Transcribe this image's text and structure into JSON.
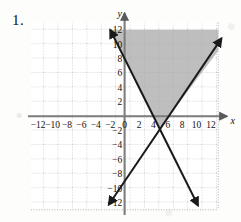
{
  "problem": {
    "number": "1."
  },
  "chart_data": {
    "type": "line",
    "title": "",
    "xlabel": "x",
    "ylabel": "y",
    "xlim": [
      -13,
      13
    ],
    "ylim": [
      -13,
      13
    ],
    "grid": true,
    "grid_style": "dotted",
    "grid_spacing": 2,
    "legend": "none",
    "x_ticks": [
      -12,
      -10,
      -8,
      -6,
      -4,
      -2,
      0,
      2,
      4,
      6,
      8,
      10,
      12
    ],
    "x_tick_labels": [
      "-12",
      "-10",
      "-8",
      "-6",
      "-4",
      "-2",
      "0",
      "2",
      "4",
      "6",
      "8",
      "10",
      "12"
    ],
    "y_ticks": [
      12,
      10,
      8,
      6,
      4,
      2,
      -2,
      -4,
      -6,
      -8,
      -10,
      -12
    ],
    "y_tick_labels": [
      "12",
      "10",
      "8",
      "6",
      "4",
      "2",
      "-2",
      "-4",
      "-6",
      "-8",
      "-10",
      "-12"
    ],
    "grid_x_range": [
      -13,
      13
    ],
    "grid_y_range": [
      -13,
      13
    ],
    "series": [
      {
        "name": "descending-boundary-line",
        "type": "line",
        "slope": -2,
        "intercept": 8,
        "equation": "y = -2x + 8",
        "x_intercept": 4,
        "y_intercept": 8,
        "style": "solid",
        "color": "#1a1a1a",
        "arrows": "both",
        "x_from": -2,
        "x_to": 10.2
      },
      {
        "name": "ascending-boundary-line",
        "type": "line",
        "slope": 1.5,
        "intercept": -9,
        "equation": "y = 1.5x - 9",
        "x_intercept": 6,
        "y_intercept": -9,
        "style": "solid",
        "color": "#1a1a1a",
        "arrows": "both",
        "x_from": -2.2,
        "x_to": 13.2
      }
    ],
    "intersection": [
      4.86,
      -1.71
    ],
    "shaded_region": {
      "name": "solution-region",
      "fill": "#a8a8a8",
      "opacity": 0.72,
      "description": "Region above y = -2x + 8 and above y = 1.5x - 9, clipped to grid",
      "vertices": [
        [
          -2,
          12
        ],
        [
          13,
          12
        ],
        [
          13,
          10.5
        ],
        [
          4.86,
          -1.71
        ],
        [
          4,
          0
        ]
      ]
    },
    "axis_color": "#8a8a8a",
    "grid_color": "#9a9a9a"
  }
}
